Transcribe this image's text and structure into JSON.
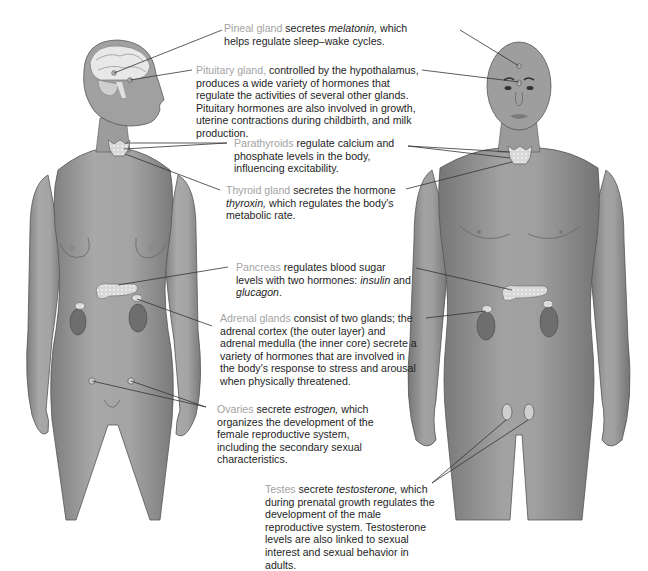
{
  "diagram": {
    "colors": {
      "term": "#a3a3a3",
      "text": "#1e1e1e",
      "skin": "#9a9a9a",
      "skin_dark": "#6e6e6e",
      "gland": "#d9d9d9",
      "leader": "#333333"
    },
    "figures": [
      {
        "name": "female-figure",
        "sex": "female"
      },
      {
        "name": "male-figure",
        "sex": "male"
      }
    ],
    "labels": [
      {
        "id": "pineal",
        "term": "Pineal gland",
        "pre": " secretes ",
        "italic": "melatonin,",
        "post": " which helps regulate sleep–wake cycles."
      },
      {
        "id": "pituitary",
        "term": "Pituitary gland,",
        "post": " controlled by the hypothalamus, produces a wide variety of hormones that regulate the activities of several other glands. Pituitary hormones are also involved in growth, uterine contractions during childbirth, and milk production."
      },
      {
        "id": "parathyroids",
        "term": "Parathyroids",
        "post": " regulate calcium and phosphate levels in the body, influencing excitability."
      },
      {
        "id": "thyroid",
        "term": "Thyroid gland",
        "pre": " secretes the hormone ",
        "italic": "thyroxin,",
        "post": " which regulates the body's metabolic rate."
      },
      {
        "id": "pancreas",
        "term": "Pancreas",
        "pre": " regulates blood sugar levels with two hormones: ",
        "italic": "insulin",
        "mid": " and ",
        "italic2": "glucagon",
        "post": "."
      },
      {
        "id": "adrenal",
        "term": "Adrenal glands",
        "post": " consist of two glands; the adrenal cortex (the outer layer) and adrenal medulla (the inner core) secrete a variety of hormones that are involved in the body's response to stress and arousal when physically threatened."
      },
      {
        "id": "ovaries",
        "term": "Ovaries",
        "pre": " secrete ",
        "italic": "estrogen,",
        "post": " which organizes the development of the female reproductive system, including the secondary sexual characteristics."
      },
      {
        "id": "testes",
        "term": "Testes",
        "pre": " secrete ",
        "italic": "testosterone,",
        "post": " which during prenatal growth regulates the development of the male reproductive system. Testosterone levels are also linked to sexual interest and sexual behavior in adults."
      }
    ]
  }
}
